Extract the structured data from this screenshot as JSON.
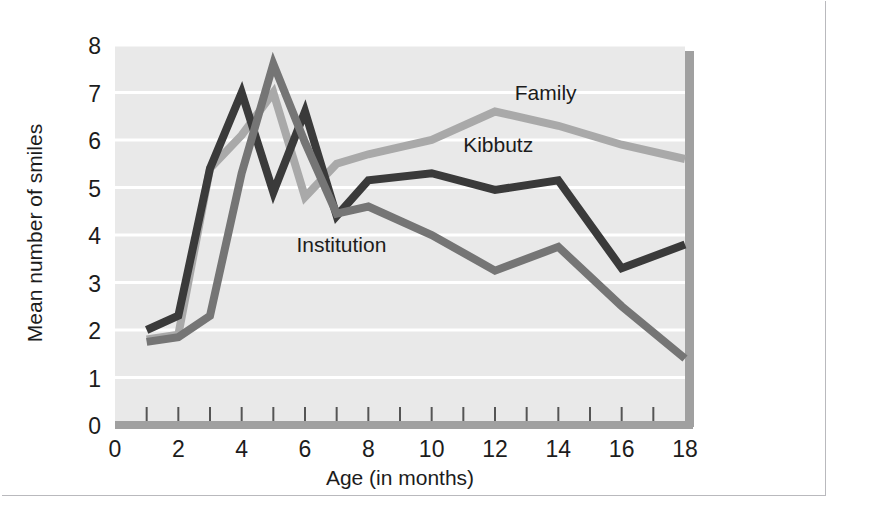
{
  "figure": {
    "caption": "",
    "background_color": "#ffffff",
    "plot_background_color": "#e9e9e9",
    "frame_color": "#b9b9bd"
  },
  "chart_data": {
    "type": "line",
    "title": "",
    "xlabel": "Age (in months)",
    "ylabel": "Mean number of smiles",
    "xlim": [
      0,
      18
    ],
    "ylim": [
      0,
      8
    ],
    "xticks": [
      0,
      2,
      4,
      6,
      8,
      10,
      12,
      14,
      16,
      18
    ],
    "xticklabels": [
      "0",
      "2",
      "4",
      "6",
      "8",
      "10",
      "12",
      "14",
      "16",
      "18"
    ],
    "minor_xticks": [
      1,
      2,
      3,
      4,
      5,
      6,
      7,
      8,
      9,
      10,
      11,
      12,
      13,
      14,
      15,
      16,
      17
    ],
    "yticks": [
      0,
      1,
      2,
      3,
      4,
      5,
      6,
      7,
      8
    ],
    "yticklabels": [
      "0",
      "1",
      "2",
      "3",
      "4",
      "5",
      "6",
      "7",
      "8"
    ],
    "grid": "horizontal-white-gridlines",
    "legend_position": "inline-labels-on-lines",
    "x": [
      1,
      2,
      3,
      4,
      5,
      6,
      7,
      8,
      10,
      12,
      14,
      16,
      18
    ],
    "series": [
      {
        "name": "Family",
        "color": "#a9a9a9",
        "label_x": 13.6,
        "label_y": 6.85,
        "values": [
          1.8,
          1.9,
          5.4,
          6.1,
          7.0,
          4.8,
          5.5,
          5.7,
          6.0,
          6.6,
          6.3,
          5.9,
          5.6
        ]
      },
      {
        "name": "Kibbutz",
        "color": "#3a3a3a",
        "label_x": 12.1,
        "label_y": 5.75,
        "values": [
          2.0,
          2.3,
          5.4,
          7.0,
          4.9,
          6.6,
          4.4,
          5.15,
          5.3,
          4.95,
          5.15,
          3.3,
          3.8
        ]
      },
      {
        "name": "Institution",
        "color": "#757575",
        "label_x": 7.15,
        "label_y": 3.65,
        "values": [
          1.75,
          1.85,
          2.3,
          5.3,
          7.6,
          5.95,
          4.45,
          4.6,
          4.0,
          3.25,
          3.75,
          2.5,
          1.4
        ]
      }
    ]
  }
}
